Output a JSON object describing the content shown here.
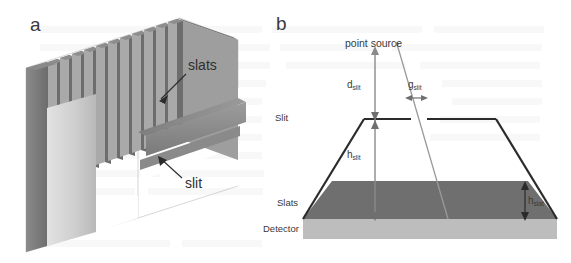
{
  "figure": {
    "panels": [
      {
        "letter": "a",
        "name": "isometric-slat-collimator",
        "labels": [
          {
            "id": "slats",
            "text": "slats"
          },
          {
            "id": "slit",
            "text": "slit"
          }
        ]
      },
      {
        "letter": "b",
        "name": "cross-section-schematic",
        "labels": [
          {
            "id": "point_source",
            "text": "point source"
          },
          {
            "id": "slit_row",
            "text": "Slit"
          },
          {
            "id": "slats_row",
            "text": "Slats"
          },
          {
            "id": "detector_row",
            "text": "Detector"
          }
        ],
        "dimensions": [
          {
            "id": "d_slit",
            "symbol": "d",
            "subscript": "slit"
          },
          {
            "id": "g_slit",
            "symbol": "g",
            "subscript": "slit"
          },
          {
            "id": "h_slit",
            "symbol": "h",
            "subscript": "slit"
          },
          {
            "id": "h_slat",
            "symbol": "h",
            "subscript": "slat"
          }
        ]
      }
    ]
  },
  "panel_a": {
    "letter": "a",
    "slats_label": "slats",
    "slit_label": "slit"
  },
  "panel_b": {
    "letter": "b",
    "point_source_label": "point source",
    "row_slit": "Slit",
    "row_slats": "Slats",
    "row_detector": "Detector",
    "d_slit_symbol": "d",
    "d_slit_sub": "slit",
    "g_slit_symbol": "g",
    "g_slit_sub": "slit",
    "h_slit_symbol": "h",
    "h_slit_sub": "slit",
    "h_slat_symbol": "h",
    "h_slat_sub": "slat"
  },
  "colors": {
    "slat_dark": "#6e6e6e",
    "slat_mid": "#8e8e8e",
    "slat_light": "#b4b4b4",
    "plate_face": "#c9c9c9",
    "plate_edge": "#757575",
    "slats_band": "#6f6f6f",
    "detector_band": "#bdbdbd",
    "outline": "#2b2b2b",
    "ray": "#8b8b8b",
    "text": "#3a3a3a",
    "background": "#ffffff"
  }
}
